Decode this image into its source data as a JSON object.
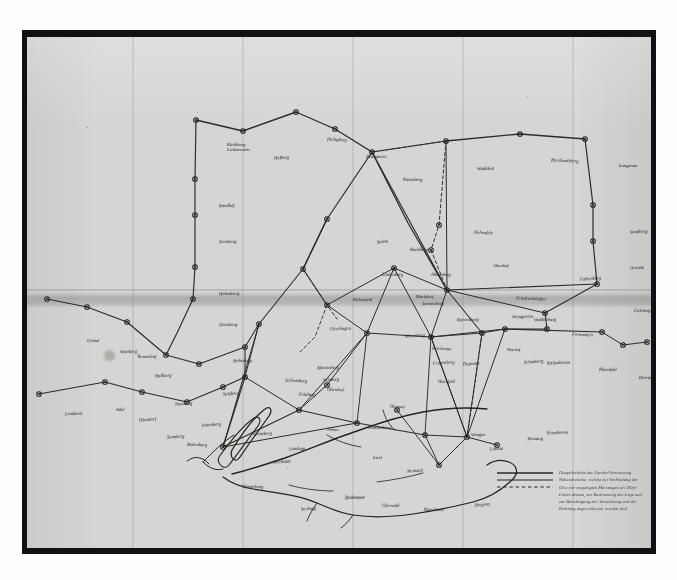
{
  "document": {
    "kind": "photograph-of-manuscript-map",
    "title_visible": false,
    "medium": "ink on paper, photographic reproduction",
    "script": "German Kurrent cursive (largely illegible at this resolution)",
    "paper_color": "#d5d5d3",
    "ink_color": "#2a2723",
    "border_color": "#111012",
    "photo_margin_color": "#fdfdfd"
  },
  "map": {
    "subject": "triangulation / survey network with lake system",
    "water_feature_note": "branching finger-lake / river outline in lower-left quadrant",
    "line_types": {
      "primary": "solid heavy ink line",
      "secondary": "solid thin ink line",
      "auxiliary": "dashed ink line"
    },
    "labels": [
      {
        "id": "n01",
        "text": "Kirchberg",
        "x": 200,
        "y": 106,
        "size": 4.6
      },
      {
        "id": "n01b",
        "text": "Lichtenstein",
        "x": 200,
        "y": 111,
        "size": 4.6
      },
      {
        "id": "n02",
        "text": "Hofberg",
        "x": 247,
        "y": 119,
        "size": 4.6
      },
      {
        "id": "n03",
        "text": "Heiligberg",
        "x": 300,
        "y": 101,
        "size": 4.6
      },
      {
        "id": "n04",
        "text": "Neuhausen",
        "x": 339,
        "y": 118,
        "size": 4.6
      },
      {
        "id": "n05",
        "text": "Rosenberg",
        "x": 376,
        "y": 141,
        "size": 4.6
      },
      {
        "id": "n06",
        "text": "Rundhof",
        "x": 192,
        "y": 167,
        "size": 4.6
      },
      {
        "id": "n07",
        "text": "Steinberg",
        "x": 192,
        "y": 203,
        "size": 4.6
      },
      {
        "id": "n08",
        "text": "Hohenberg",
        "x": 192,
        "y": 255,
        "size": 4.6
      },
      {
        "id": "n09",
        "text": "Ottenberg",
        "x": 192,
        "y": 286,
        "size": 4.6
      },
      {
        "id": "n10",
        "text": "Waldshut",
        "x": 450,
        "y": 130,
        "size": 4.6
      },
      {
        "id": "n11",
        "text": "Bernhardsberg",
        "x": 524,
        "y": 122,
        "size": 4.6
      },
      {
        "id": "n12",
        "text": "Langenau",
        "x": 592,
        "y": 127,
        "size": 4.6
      },
      {
        "id": "n13",
        "text": "Sandberg",
        "x": 603,
        "y": 193,
        "size": 4.6
      },
      {
        "id": "n14",
        "text": "Grunau",
        "x": 603,
        "y": 229,
        "size": 4.6
      },
      {
        "id": "n15",
        "text": "Eichberg",
        "x": 607,
        "y": 272,
        "size": 4.6
      },
      {
        "id": "n16",
        "text": "Hohenfels",
        "x": 447,
        "y": 194,
        "size": 4.6
      },
      {
        "id": "n17",
        "text": "Altenhof",
        "x": 466,
        "y": 227,
        "size": 4.6
      },
      {
        "id": "n18",
        "text": "Falkenberg",
        "x": 553,
        "y": 240,
        "size": 4.6
      },
      {
        "id": "n19",
        "text": "Buchberg",
        "x": 383,
        "y": 211,
        "size": 4.6
      },
      {
        "id": "n20",
        "text": "Ahornberg",
        "x": 404,
        "y": 236,
        "size": 4.6
      },
      {
        "id": "n21",
        "text": "Lindenberg",
        "x": 355,
        "y": 236,
        "size": 4.6
      },
      {
        "id": "n22",
        "text": "Birkenfeld",
        "x": 326,
        "y": 261,
        "size": 4.6
      },
      {
        "id": "n23",
        "text": "Sonnenberg",
        "x": 395,
        "y": 265,
        "size": 4.6
      },
      {
        "id": "n24",
        "text": "Waldenburg",
        "x": 507,
        "y": 281,
        "size": 4.6
      },
      {
        "id": "n25",
        "text": "Freienstein",
        "x": 545,
        "y": 296,
        "size": 4.6
      },
      {
        "id": "n26",
        "text": "Marienberg",
        "x": 290,
        "y": 329,
        "size": 4.6
      },
      {
        "id": "n27",
        "text": "Sulzberg",
        "x": 296,
        "y": 341,
        "size": 4.6
      },
      {
        "id": "n28",
        "text": "Oberdorf",
        "x": 300,
        "y": 351,
        "size": 4.6
      },
      {
        "id": "n29",
        "text": "Reichenau",
        "x": 405,
        "y": 310,
        "size": 4.6
      },
      {
        "id": "n30",
        "text": "Frauenberg",
        "x": 406,
        "y": 324,
        "size": 4.6
      },
      {
        "id": "n31",
        "text": "Hochfeld",
        "x": 411,
        "y": 343,
        "size": 4.6
      },
      {
        "id": "n32",
        "text": "Degenau",
        "x": 436,
        "y": 325,
        "size": 4.6
      },
      {
        "id": "n33",
        "text": "Neuhof",
        "x": 480,
        "y": 311,
        "size": 4.6
      },
      {
        "id": "n34",
        "text": "Schonberg",
        "x": 497,
        "y": 323,
        "size": 4.6
      },
      {
        "id": "n35",
        "text": "Kaltenbrunn",
        "x": 520,
        "y": 324,
        "size": 4.6
      },
      {
        "id": "n36",
        "text": "Rheinfeld",
        "x": 572,
        "y": 331,
        "size": 4.6
      },
      {
        "id": "n37",
        "text": "Dornau",
        "x": 612,
        "y": 339,
        "size": 4.6
      },
      {
        "id": "n38",
        "text": "Giebel",
        "x": 60,
        "y": 302,
        "size": 4.6
      },
      {
        "id": "n39",
        "text": "Wartberg",
        "x": 93,
        "y": 313,
        "size": 4.6
      },
      {
        "id": "n40",
        "text": "Tannenhof",
        "x": 110,
        "y": 318,
        "size": 4.6
      },
      {
        "id": "n41",
        "text": "Hallberg",
        "x": 128,
        "y": 337,
        "size": 4.6
      },
      {
        "id": "n42",
        "text": "Nussberg",
        "x": 148,
        "y": 365,
        "size": 4.6
      },
      {
        "id": "n43",
        "text": "Leutkirch",
        "x": 38,
        "y": 375,
        "size": 4.6
      },
      {
        "id": "n44",
        "text": "Adel",
        "x": 89,
        "y": 371,
        "size": 4.6
      },
      {
        "id": "n45",
        "text": "Oberdorf",
        "x": 112,
        "y": 381,
        "size": 4.6
      },
      {
        "id": "n46",
        "text": "Sonnberg",
        "x": 140,
        "y": 398,
        "size": 4.6
      },
      {
        "id": "n47",
        "text": "Bodenburg",
        "x": 160,
        "y": 406,
        "size": 4.6
      },
      {
        "id": "n48",
        "text": "Rotenberg",
        "x": 175,
        "y": 386,
        "size": 4.6
      },
      {
        "id": "n49",
        "text": "Hohenegg",
        "x": 206,
        "y": 322,
        "size": 4.6
      },
      {
        "id": "n50",
        "text": "Salzberg",
        "x": 196,
        "y": 355,
        "size": 4.6
      },
      {
        "id": "n51",
        "text": "Schlossberg",
        "x": 258,
        "y": 342,
        "size": 4.6
      },
      {
        "id": "n52",
        "text": "Feldberg",
        "x": 272,
        "y": 356,
        "size": 4.6
      },
      {
        "id": "n53",
        "text": "Kreuzberg",
        "x": 226,
        "y": 395,
        "size": 4.6
      },
      {
        "id": "n54",
        "text": "Landegg",
        "x": 262,
        "y": 410,
        "size": 4.6
      },
      {
        "id": "n55",
        "text": "Wasserburg",
        "x": 215,
        "y": 448,
        "size": 4.6
      },
      {
        "id": "n56",
        "text": "Hochstatt",
        "x": 246,
        "y": 423,
        "size": 4.6
      },
      {
        "id": "n57",
        "text": "Seeburg",
        "x": 274,
        "y": 470,
        "size": 4.6
      },
      {
        "id": "n58",
        "text": "Bodensee",
        "x": 318,
        "y": 458,
        "size": 5.2
      },
      {
        "id": "n59",
        "text": "Uferwald",
        "x": 355,
        "y": 467,
        "size": 4.6
      },
      {
        "id": "n60",
        "text": "Insel",
        "x": 346,
        "y": 419,
        "size": 4.6
      },
      {
        "id": "n61",
        "text": "Steinach",
        "x": 380,
        "y": 432,
        "size": 4.6
      },
      {
        "id": "n62",
        "text": "Rorschach",
        "x": 397,
        "y": 471,
        "size": 4.6
      },
      {
        "id": "n63",
        "text": "Bregenz",
        "x": 448,
        "y": 466,
        "size": 4.6
      },
      {
        "id": "n64",
        "text": "Lindau",
        "x": 463,
        "y": 410,
        "size": 4.6
      },
      {
        "id": "n65",
        "text": "Wangen",
        "x": 444,
        "y": 396,
        "size": 4.6
      },
      {
        "id": "n66",
        "text": "Arbon",
        "x": 300,
        "y": 391,
        "size": 4.6
      },
      {
        "id": "n67",
        "text": "Romanshorn",
        "x": 341,
        "y": 389,
        "size": 4.6
      },
      {
        "id": "n68",
        "text": "Hagnau",
        "x": 363,
        "y": 368,
        "size": 4.6
      },
      {
        "id": "n69",
        "text": "Meersburg",
        "x": 378,
        "y": 297,
        "size": 4.6
      },
      {
        "id": "n70",
        "text": "Uberlingen",
        "x": 303,
        "y": 290,
        "size": 4.6
      },
      {
        "id": "n71",
        "text": "Markdorf",
        "x": 389,
        "y": 258,
        "size": 4.6
      },
      {
        "id": "n72",
        "text": "Ravensburg",
        "x": 430,
        "y": 281,
        "size": 4.6
      },
      {
        "id": "n73",
        "text": "Weingarten",
        "x": 485,
        "y": 278,
        "size": 4.6
      },
      {
        "id": "n74",
        "text": "Tettnang",
        "x": 500,
        "y": 400,
        "size": 4.6
      },
      {
        "id": "n75",
        "text": "Kressbronn",
        "x": 520,
        "y": 394,
        "size": 4.6
      },
      {
        "id": "n76",
        "text": "Friedrichshafen",
        "x": 489,
        "y": 260,
        "size": 4.6
      },
      {
        "id": "n77",
        "text": "Salem",
        "x": 350,
        "y": 203,
        "size": 4.6
      }
    ],
    "legend": {
      "entries": [
        {
          "style": "solid-thick",
          "text": "Hauptdreiecke der Landes-Vermessung"
        },
        {
          "style": "solid-thin",
          "text": "Nebendreiecke, welche zur Verbindung der Orte"
        },
        {
          "style": "dashed",
          "text": "mit vorgelegten Messungen als Hilfs-Linien dienen, zur Bestimmung der Lage und zur Berichtigung der Abweichung und der Richtung angeschlossen worden sind"
        }
      ]
    }
  }
}
